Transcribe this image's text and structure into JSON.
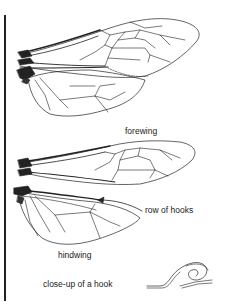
{
  "figure": {
    "labels": {
      "forewing": "forewing",
      "row_of_hooks": "row of hooks",
      "hindwing": "hindwing",
      "closeup": "close-up of a hook"
    },
    "panels": [
      {
        "name": "wings-joined",
        "description": "forewing and hindwing joined in flight position"
      },
      {
        "name": "wings-separated",
        "description": "forewing and hindwing separated with row of hooks indicated"
      },
      {
        "name": "hook-closeup",
        "description": "magnified hook"
      }
    ],
    "colors": {
      "ink": "#222222",
      "background": "#ffffff"
    }
  }
}
